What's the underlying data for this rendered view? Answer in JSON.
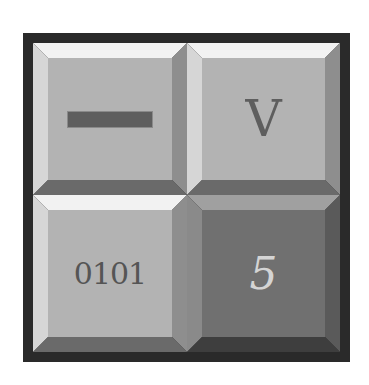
{
  "keypad": {
    "keys": [
      {
        "id": "minus",
        "label": "",
        "icon": "minus-bar",
        "style": "light"
      },
      {
        "id": "v",
        "label": "V",
        "style": "light"
      },
      {
        "id": "binary",
        "label": "0101",
        "style": "light"
      },
      {
        "id": "five",
        "label": "5",
        "style": "dark"
      }
    ]
  },
  "colors": {
    "frame": "#2a2a2a",
    "key_face_light": "#b3b3b3",
    "key_face_dark": "#707070",
    "glyph_dark": "#5e5e5e",
    "glyph_light": "#d4d4d4"
  }
}
